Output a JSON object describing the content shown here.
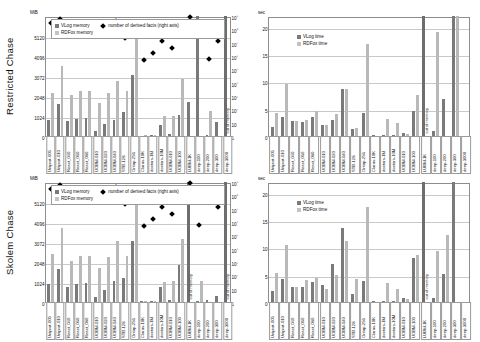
{
  "figure": {
    "rows": [
      {
        "id": "restricted",
        "label": "Restricted Chase"
      },
      {
        "id": "skolem",
        "label": "Skolem Chase"
      }
    ]
  },
  "legends": {
    "memory": {
      "vlog": "VLog memory",
      "rdfox": "RDFox memory",
      "derived": "number of derived facts (right axis)"
    },
    "time": {
      "vlog": "VLog time",
      "rdfox": "RDFox time"
    }
  },
  "axes": {
    "memory_unit": "MiB",
    "memory_ticks": [
      "5120",
      "4096",
      "3072",
      "2048",
      "1024",
      "0"
    ],
    "facts_ticks": [
      "10⁹",
      "10⁸",
      "10⁷",
      "10⁶",
      "10⁵",
      "10⁴",
      "10³",
      "10²",
      "10",
      "1"
    ],
    "time_unit": "sec",
    "time_ticks": [
      "20",
      "15",
      "10",
      "5",
      "0"
    ]
  },
  "annotations": {
    "out_of_memory": "out of memory"
  },
  "categories": [
    "Uniprot-005",
    "Uniprot-010",
    "React_040",
    "React_060",
    "React_080",
    "UOBM-010",
    "UOBM-020",
    "UOBM-040",
    "STB-128",
    "Ontop-256",
    "Claros-10K",
    "doctors-1M",
    "doctors-10M",
    "UOBM-010",
    "UOBM-100",
    "LUBM-1K",
    "deep-100",
    "deep-200",
    "deep-300",
    "deep-3000"
  ],
  "chart_data": [
    {
      "type": "bar",
      "id": "restricted-memory",
      "title": "Restricted Chase — memory",
      "xlabel": "",
      "ylabel": "MiB",
      "ylim": [
        0,
        6144
      ],
      "y2label": "number of derived facts",
      "y2lim": [
        1,
        1000000000
      ],
      "y2scale": "log",
      "grid": true,
      "legend_position": "top-left",
      "categories": [
        "Uniprot-005",
        "Uniprot-010",
        "React_040",
        "React_060",
        "React_080",
        "UOBM-010",
        "UOBM-020",
        "UOBM-040",
        "STB-128",
        "Ontop-256",
        "Claros-10K",
        "doctors-1M",
        "doctors-10M",
        "UOBM-010",
        "UOBM-100",
        "LUBM-1K",
        "deep-100",
        "deep-200",
        "deep-300",
        "deep-3000"
      ],
      "series": [
        {
          "name": "VLog memory",
          "values": [
            800,
            1640,
            760,
            880,
            900,
            250,
            620,
            800,
            1250,
            3100,
            20,
            40,
            540,
            100,
            1100,
            1750,
            6144,
            60,
            700,
            6144
          ]
        },
        {
          "name": "RDFox memory",
          "values": [
            2200,
            3600,
            2080,
            2300,
            2300,
            1700,
            2200,
            2800,
            2300,
            5250,
            40,
            60,
            1000,
            1050,
            2900,
            0,
            0,
            1300,
            0,
            0
          ]
        },
        {
          "name": "number of derived facts",
          "values": [
            280000000,
            560000000,
            210000000,
            230000000,
            250000000,
            90000000,
            180000000,
            400000000,
            22000000,
            95000000,
            500000,
            1800000,
            14000000,
            4000000,
            220000000,
            900000000,
            0,
            600000,
            13000000,
            0
          ]
        }
      ],
      "out_of_memory_bars": [
        "LUBM-1K",
        "deep-3000"
      ]
    },
    {
      "type": "bar",
      "id": "restricted-time",
      "title": "Restricted Chase — time",
      "xlabel": "",
      "ylabel": "sec",
      "ylim": [
        0,
        22
      ],
      "grid": true,
      "legend_position": "top-left",
      "categories": [
        "Uniprot-005",
        "Uniprot-010",
        "React_040",
        "React_060",
        "React_080",
        "UOBM-010",
        "UOBM-020",
        "UOBM-040",
        "STB-128",
        "Ontop-256",
        "Claros-10K",
        "doctors-1M",
        "doctors-10M",
        "UOBM-010",
        "UOBM-100",
        "LUBM-1K",
        "deep-100",
        "deep-200",
        "deep-300",
        "deep-3000"
      ],
      "series": [
        {
          "name": "VLog time",
          "values": [
            1.7,
            3.4,
            2.7,
            2.5,
            3.5,
            2.1,
            3.0,
            8.6,
            1.3,
            4.2,
            0.1,
            0.2,
            0.15,
            0.6,
            4.6,
            22.0,
            1.0,
            6.7,
            22.0,
            0
          ]
        },
        {
          "name": "RDFox time",
          "values": [
            4.3,
            9.6,
            2.7,
            2.9,
            4.5,
            2.0,
            4.0,
            8.6,
            1.5,
            16.8,
            0.05,
            3.2,
            2.3,
            0.4,
            7.6,
            0,
            19.0,
            0,
            23.0,
            0
          ]
        }
      ],
      "out_of_memory_bars": [
        "LUBM-1K",
        "deep-3000"
      ]
    },
    {
      "type": "bar",
      "id": "skolem-memory",
      "title": "Skolem Chase — memory",
      "xlabel": "",
      "ylabel": "MiB",
      "ylim": [
        0,
        6144
      ],
      "y2label": "number of derived facts",
      "y2lim": [
        1,
        1000000000
      ],
      "y2scale": "log",
      "grid": true,
      "legend_position": "top-left",
      "categories": [
        "Uniprot-005",
        "Uniprot-010",
        "React_040",
        "React_060",
        "React_080",
        "UOBM-010",
        "UOBM-020",
        "UOBM-040",
        "STB-128",
        "Ontop-256",
        "Claros-10K",
        "doctors-1M",
        "doctors-10M",
        "UOBM-010",
        "UOBM-100",
        "LUBM-1K",
        "deep-100",
        "deep-200",
        "deep-300",
        "deep-3000"
      ],
      "series": [
        {
          "name": "VLog memory",
          "values": [
            900,
            1700,
            780,
            900,
            950,
            250,
            640,
            1080,
            1250,
            3100,
            30,
            60,
            780,
            120,
            1900,
            6144,
            60,
            100,
            320,
            6144
          ]
        },
        {
          "name": "RDFox memory",
          "values": [
            2450,
            3800,
            2100,
            2350,
            2350,
            1750,
            2300,
            3100,
            2350,
            5200,
            40,
            70,
            1050,
            1080,
            3250,
            0,
            1100,
            0,
            0,
            0
          ]
        },
        {
          "name": "number of derived facts",
          "values": [
            280000000,
            560000000,
            200000000,
            220000000,
            240000000,
            95000000,
            190000000,
            400000000,
            22000000,
            110000000,
            500000,
            1700000,
            13000000,
            4200000,
            230000000,
            900000000,
            600000,
            0,
            13000000,
            0
          ]
        }
      ],
      "out_of_memory_bars": [
        "LUBM-1K",
        "deep-3000"
      ]
    },
    {
      "type": "bar",
      "id": "skolem-time",
      "title": "Skolem Chase — time",
      "xlabel": "",
      "ylabel": "sec",
      "ylim": [
        0,
        22
      ],
      "grid": true,
      "legend_position": "top-left",
      "categories": [
        "Uniprot-005",
        "Uniprot-010",
        "React_040",
        "React_060",
        "React_080",
        "UOBM-010",
        "UOBM-020",
        "UOBM-040",
        "STB-128",
        "Ontop-256",
        "Claros-10K",
        "doctors-1M",
        "doctors-10M",
        "UOBM-010",
        "UOBM-100",
        "LUBM-1K",
        "deep-100",
        "deep-200",
        "deep-300",
        "deep-3000"
      ],
      "series": [
        {
          "name": "VLog time",
          "values": [
            2.1,
            4.3,
            2.7,
            2.7,
            3.6,
            3.1,
            6.9,
            13.6,
            1.4,
            3.8,
            0.1,
            0.2,
            0.2,
            0.7,
            8.0,
            22.0,
            0.7,
            5.2,
            22.0,
            0
          ]
        },
        {
          "name": "RDFox time",
          "values": [
            5.3,
            10.5,
            2.8,
            4.0,
            4.4,
            2.4,
            5.0,
            11.2,
            4.3,
            17.4,
            0.05,
            3.4,
            2.4,
            0.6,
            8.6,
            0,
            9.3,
            12.3,
            0,
            0
          ]
        }
      ],
      "out_of_memory_bars": [
        "LUBM-1K",
        "deep-3000"
      ]
    }
  ]
}
